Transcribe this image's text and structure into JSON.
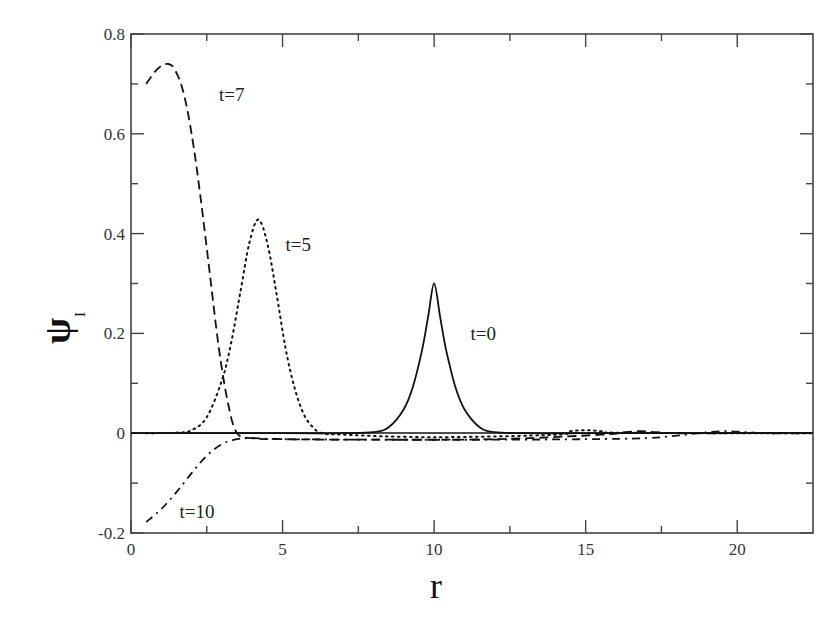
{
  "chart_data": {
    "type": "line",
    "title": "",
    "xlabel": "r",
    "ylabel": "ψ",
    "ylabel_subscript": "I",
    "xlim": [
      0,
      22.5
    ],
    "ylim": [
      -0.2,
      0.8
    ],
    "x_ticks": [
      0,
      5,
      10,
      15,
      20
    ],
    "x_minor_ticks": [
      2.5,
      7.5,
      12.5,
      17.5
    ],
    "y_ticks": [
      -0.2,
      0,
      0.2,
      0.4,
      0.6,
      0.8
    ],
    "y_tick_labels": [
      "-0.2",
      "0",
      "0.2",
      "0.4",
      "0.6",
      "0.8"
    ],
    "y_minor_ticks": [
      -0.1,
      0.1,
      0.3,
      0.5,
      0.7
    ],
    "grid": false,
    "legend": "inline labels",
    "series": [
      {
        "name": "t=0",
        "style": "solid",
        "label_pos": [
          11.2,
          0.2
        ],
        "x": [
          0,
          5,
          7,
          8,
          8.5,
          9,
          9.3,
          9.6,
          9.8,
          10,
          10.2,
          10.4,
          10.7,
          11,
          11.5,
          12,
          13,
          15,
          17,
          20,
          22.5
        ],
        "y": [
          0,
          0,
          0,
          0.002,
          0.012,
          0.048,
          0.093,
          0.166,
          0.232,
          0.3,
          0.232,
          0.166,
          0.093,
          0.048,
          0.012,
          0.002,
          0,
          0,
          0,
          0,
          0
        ]
      },
      {
        "name": "t=5",
        "style": "dotted",
        "label_pos": [
          5.1,
          0.38
        ],
        "x": [
          0.5,
          1.5,
          2,
          2.5,
          3,
          3.3,
          3.6,
          3.9,
          4.2,
          4.5,
          4.8,
          5.1,
          5.4,
          5.7,
          6,
          6.3,
          7,
          10,
          14,
          14.5,
          15,
          15.5,
          16,
          20,
          22.5
        ],
        "y": [
          0,
          0.001,
          0.006,
          0.032,
          0.106,
          0.18,
          0.28,
          0.38,
          0.428,
          0.38,
          0.28,
          0.17,
          0.09,
          0.038,
          0.012,
          0,
          -0.003,
          -0.008,
          -0.003,
          0.004,
          0.006,
          0.004,
          0.001,
          0,
          0
        ]
      },
      {
        "name": "t=7",
        "style": "dashed",
        "label_pos": [
          2.9,
          0.68
        ],
        "x": [
          0.5,
          0.8,
          1.0,
          1.2,
          1.4,
          1.7,
          2.0,
          2.3,
          2.6,
          2.9,
          3.2,
          3.5,
          4,
          5,
          8,
          12,
          15.5,
          16.3,
          16.8,
          17.3,
          18,
          20,
          22.5
        ],
        "y": [
          0.7,
          0.725,
          0.736,
          0.74,
          0.733,
          0.69,
          0.6,
          0.47,
          0.32,
          0.17,
          0.06,
          0.0,
          -0.01,
          -0.012,
          -0.013,
          -0.012,
          -0.003,
          0.002,
          0.004,
          0.002,
          0,
          0,
          0
        ]
      },
      {
        "name": "t=10",
        "style": "dash-dot",
        "label_pos": [
          1.6,
          -0.155
        ],
        "x": [
          0.5,
          1.0,
          1.5,
          2.0,
          2.5,
          3.0,
          3.5,
          4,
          5,
          8,
          12,
          15,
          17,
          18,
          18.7,
          19.5,
          20.3,
          21,
          22.5
        ],
        "y": [
          -0.178,
          -0.152,
          -0.118,
          -0.08,
          -0.045,
          -0.022,
          -0.012,
          -0.01,
          -0.012,
          -0.013,
          -0.013,
          -0.012,
          -0.01,
          -0.005,
          0,
          0.004,
          0.002,
          0,
          0
        ]
      }
    ]
  }
}
